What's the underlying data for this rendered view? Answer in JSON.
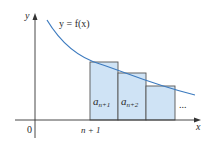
{
  "diagram": {
    "type": "integral-test-rectangles",
    "curve_label": "y = f(x)",
    "axis_labels": {
      "x": "x",
      "y": "y"
    },
    "origin_label": "0",
    "tick_labels": [
      {
        "label": "n + 1",
        "position": "left edge of first rectangle"
      }
    ],
    "rectangles": [
      {
        "label_base": "a",
        "label_sub": "n+1"
      },
      {
        "label_base": "a",
        "label_sub": "n+2"
      },
      {
        "label_base": "",
        "label_sub": ""
      }
    ],
    "continuation": "...",
    "colors": {
      "curve": "#3d7bbf",
      "rect_fill": "#cfe3f5",
      "rect_stroke": "#555555",
      "axis": "#333333"
    }
  }
}
